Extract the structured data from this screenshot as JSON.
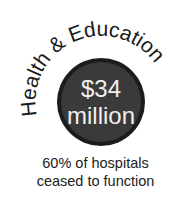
{
  "category": {
    "title": "Health & Education"
  },
  "badge": {
    "amount": "$34",
    "unit": "million",
    "fill_color": "#3a3a3a",
    "ring_color": "#1c1c1c",
    "text_color": "#f0f0f0"
  },
  "caption": {
    "line1": "60% of hospitals",
    "line2": "ceased to function"
  }
}
